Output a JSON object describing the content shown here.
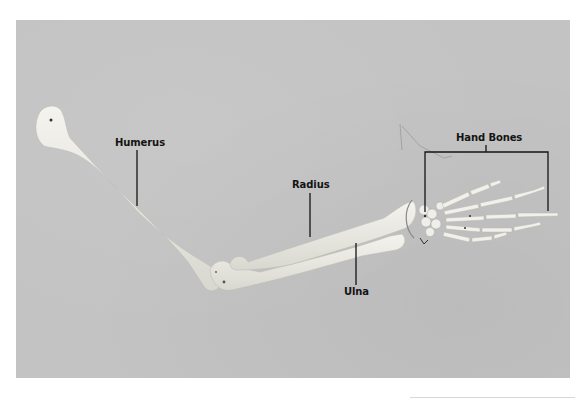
{
  "figure": {
    "background_color": "#c3c3c3",
    "bone_color": "#ecebe4",
    "leader_line_color": "#141414"
  },
  "labels": {
    "humerus": "Humerus",
    "radius": "Radius",
    "ulna": "Ulna",
    "hand_bones": "Hand Bones"
  }
}
